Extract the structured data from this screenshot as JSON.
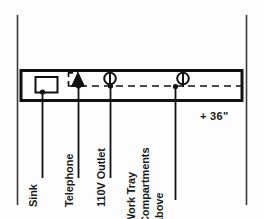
{
  "drawing": {
    "type": "elevation",
    "title": "Casework Elevation",
    "background_color": "#fdfdfd",
    "line_color": "#111111",
    "counter": {
      "name": "counter-millwork-body",
      "mounting_height_label": "+ 36\"",
      "dashed_centerline": true
    },
    "fixtures": [
      {
        "id": "sink",
        "symbol": "rectangle",
        "label": "Sink",
        "label_lines": [
          "Sink"
        ],
        "leader_x": 42
      },
      {
        "id": "telephone",
        "symbol": "filled-triangle",
        "label": "Telephone",
        "label_lines": [
          "Telephone"
        ],
        "leader_x": 78
      },
      {
        "id": "outlet-110v",
        "symbol": "circle-with-line",
        "label": "110V Outlet",
        "label_lines": [
          "110V Outlet"
        ],
        "leader_x": 110
      },
      {
        "id": "work-tray-compartments",
        "symbol": "circle-with-line",
        "label": "Work Tray Compartments above",
        "label_lines": [
          "Work Tray",
          "Compartments",
          "above"
        ],
        "leader_x": 175
      }
    ],
    "dimension": {
      "name": "mounting-height-dimension",
      "text": "+ 36\""
    },
    "borders": {
      "left_line": true,
      "right_line": true
    }
  }
}
